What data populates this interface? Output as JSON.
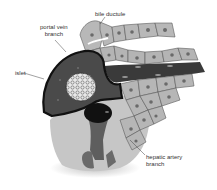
{
  "diagram": {
    "type": "anatomical-illustration",
    "colors": {
      "background": "#ffffff",
      "hepatocyte_fill": "#b4b4b4",
      "hepatocyte_nucleus": "#6a6a6a",
      "hepatocyte_border": "#5a5a5a",
      "portal_vein_fill": "#4a4a4a",
      "portal_vein_outline": "#111111",
      "islet_fill": "#e6e6e6",
      "connective_tissue": "#c8c8c8",
      "artery_fill": "#111111",
      "label_text": "#333333",
      "leader_line": "#444444"
    },
    "labels": {
      "portal_vein": [
        "portal vein",
        "branch"
      ],
      "bile_ductule": "bile ductule",
      "islet": "islet",
      "hepatic_artery": [
        "hepatic artery",
        "branch"
      ]
    }
  }
}
